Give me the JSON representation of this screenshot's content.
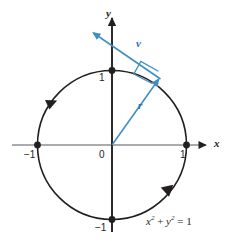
{
  "figure": {
    "name": "unit-circle-with-position-and-velocity-vectors",
    "background_color": "#ffffff",
    "width": 234,
    "height": 242
  },
  "colors": {
    "axis": "#8d8f92",
    "curve": "#231f20",
    "vector_blue": "#3f8fc5",
    "vector_label_blue": "#1f6fb2",
    "point": "#231f20",
    "text": "#231f20"
  },
  "axes": {
    "x_label": "x",
    "y_label": "y",
    "origin_label": "0",
    "x_ticks": [
      {
        "label": "-1",
        "display": "−1",
        "value": -1
      },
      {
        "label": "1",
        "display": "1",
        "value": 1
      }
    ],
    "y_ticks": [
      {
        "label": "1",
        "display": "1",
        "value": 1
      },
      {
        "label": "-1",
        "display": "−1",
        "value": -1
      }
    ]
  },
  "curve": {
    "name": "unit-circle",
    "equation_text": "x2 + y2 = 1",
    "equation_parts": {
      "x_var": "x",
      "x_exp": "2",
      "plus": "+",
      "y_var": "y",
      "y_exp": "2",
      "equals": "= 1"
    },
    "center": [
      0,
      0
    ],
    "radius": 1,
    "direction": "counterclockwise",
    "direction_marker_count": 2
  },
  "vectors": [
    {
      "name": "r",
      "label": "r",
      "description": "position vector from origin to point on circle",
      "from": [
        0,
        0
      ],
      "to": [
        0.545,
        0.838
      ]
    },
    {
      "name": "v",
      "label": "v",
      "description": "velocity vector tangent to circle, perpendicular to r",
      "from": [
        0.545,
        0.838
      ],
      "to": [
        -0.27,
        1.52
      ]
    }
  ],
  "markers": {
    "right_angle": {
      "name": "right-angle-marker",
      "at": [
        0.545,
        0.838
      ],
      "between": [
        "r",
        "v"
      ]
    },
    "points": [
      {
        "name": "point-right",
        "at": [
          1,
          0
        ]
      },
      {
        "name": "point-left",
        "at": [
          -1,
          0
        ]
      },
      {
        "name": "point-top",
        "at": [
          0,
          1
        ]
      },
      {
        "name": "point-bottom",
        "at": [
          0,
          -1
        ]
      },
      {
        "name": "point-tangent",
        "at": [
          0.545,
          0.838
        ]
      }
    ]
  }
}
